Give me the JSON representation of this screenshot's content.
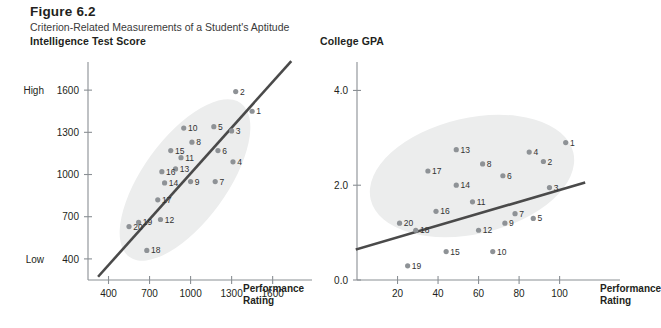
{
  "figure": {
    "number": "Figure 6.2",
    "caption": "Criterion-Related Measurements of a Student's Aptitude"
  },
  "axis_name_line1": "Performance",
  "axis_name_line2": "Rating",
  "chart_data": [
    {
      "type": "scatter",
      "title": "Intelligence Test Score",
      "xlabel": "Performance Rating",
      "ylabel": "Intelligence Test Score",
      "xticks": [
        400,
        700,
        1000,
        1300,
        1600
      ],
      "yticks": [
        400,
        700,
        1000,
        1300,
        1600
      ],
      "ylim": [
        250,
        1800
      ],
      "xlim": [
        250,
        1800
      ],
      "y_low_label": "Low",
      "y_high_label": "High",
      "grid": false,
      "legend": "none",
      "annotations": [
        "ellipse data cloud",
        "positive trend line"
      ],
      "points": [
        {
          "label": "1",
          "x": 1450,
          "y": 1450
        },
        {
          "label": "2",
          "x": 1330,
          "y": 1590
        },
        {
          "label": "3",
          "x": 1300,
          "y": 1310
        },
        {
          "label": "4",
          "x": 1310,
          "y": 1090
        },
        {
          "label": "5",
          "x": 1170,
          "y": 1340
        },
        {
          "label": "6",
          "x": 1200,
          "y": 1170
        },
        {
          "label": "7",
          "x": 1180,
          "y": 950
        },
        {
          "label": "8",
          "x": 1010,
          "y": 1230
        },
        {
          "label": "9",
          "x": 1000,
          "y": 950
        },
        {
          "label": "10",
          "x": 950,
          "y": 1330
        },
        {
          "label": "11",
          "x": 930,
          "y": 1120
        },
        {
          "label": "12",
          "x": 780,
          "y": 680
        },
        {
          "label": "13",
          "x": 890,
          "y": 1040
        },
        {
          "label": "14",
          "x": 810,
          "y": 940
        },
        {
          "label": "15",
          "x": 855,
          "y": 1170
        },
        {
          "label": "16",
          "x": 790,
          "y": 1020
        },
        {
          "label": "17",
          "x": 760,
          "y": 820
        },
        {
          "label": "18",
          "x": 680,
          "y": 460
        },
        {
          "label": "19",
          "x": 620,
          "y": 660
        },
        {
          "label": "20",
          "x": 550,
          "y": 630
        }
      ],
      "trend": {
        "x1": 330,
        "y1": 280,
        "x2": 1730,
        "y2": 1800
      }
    },
    {
      "type": "scatter",
      "title": "College GPA",
      "xlabel": "Performance Rating",
      "ylabel": "College GPA",
      "xticks": [
        20,
        40,
        60,
        80,
        100
      ],
      "yticks": [
        "0.0",
        "2.0",
        "4.0"
      ],
      "ylim": [
        0.0,
        4.6
      ],
      "xlim": [
        0,
        115
      ],
      "grid": false,
      "legend": "none",
      "annotations": [
        "ellipse data cloud",
        "weak positive trend line"
      ],
      "points": [
        {
          "label": "1",
          "x": 103,
          "y": 2.9
        },
        {
          "label": "2",
          "x": 92,
          "y": 2.5
        },
        {
          "label": "3",
          "x": 95,
          "y": 1.95
        },
        {
          "label": "4",
          "x": 85,
          "y": 2.7
        },
        {
          "label": "5",
          "x": 87,
          "y": 1.3
        },
        {
          "label": "6",
          "x": 72,
          "y": 2.2
        },
        {
          "label": "7",
          "x": 78,
          "y": 1.4
        },
        {
          "label": "8",
          "x": 62,
          "y": 2.45
        },
        {
          "label": "9",
          "x": 73,
          "y": 1.2
        },
        {
          "label": "10",
          "x": 67,
          "y": 0.6
        },
        {
          "label": "11",
          "x": 57,
          "y": 1.65
        },
        {
          "label": "12",
          "x": 60,
          "y": 1.05
        },
        {
          "label": "13",
          "x": 49,
          "y": 2.75
        },
        {
          "label": "14",
          "x": 49,
          "y": 2.0
        },
        {
          "label": "15",
          "x": 44,
          "y": 0.6
        },
        {
          "label": "16",
          "x": 39,
          "y": 1.45
        },
        {
          "label": "17",
          "x": 35,
          "y": 2.3
        },
        {
          "label": "18",
          "x": 29,
          "y": 1.05
        },
        {
          "label": "19",
          "x": 25,
          "y": 0.3
        },
        {
          "label": "20",
          "x": 21,
          "y": 1.2
        }
      ],
      "trend": {
        "x1": 0,
        "y1": 0.65,
        "x2": 112,
        "y2": 2.05
      }
    }
  ]
}
